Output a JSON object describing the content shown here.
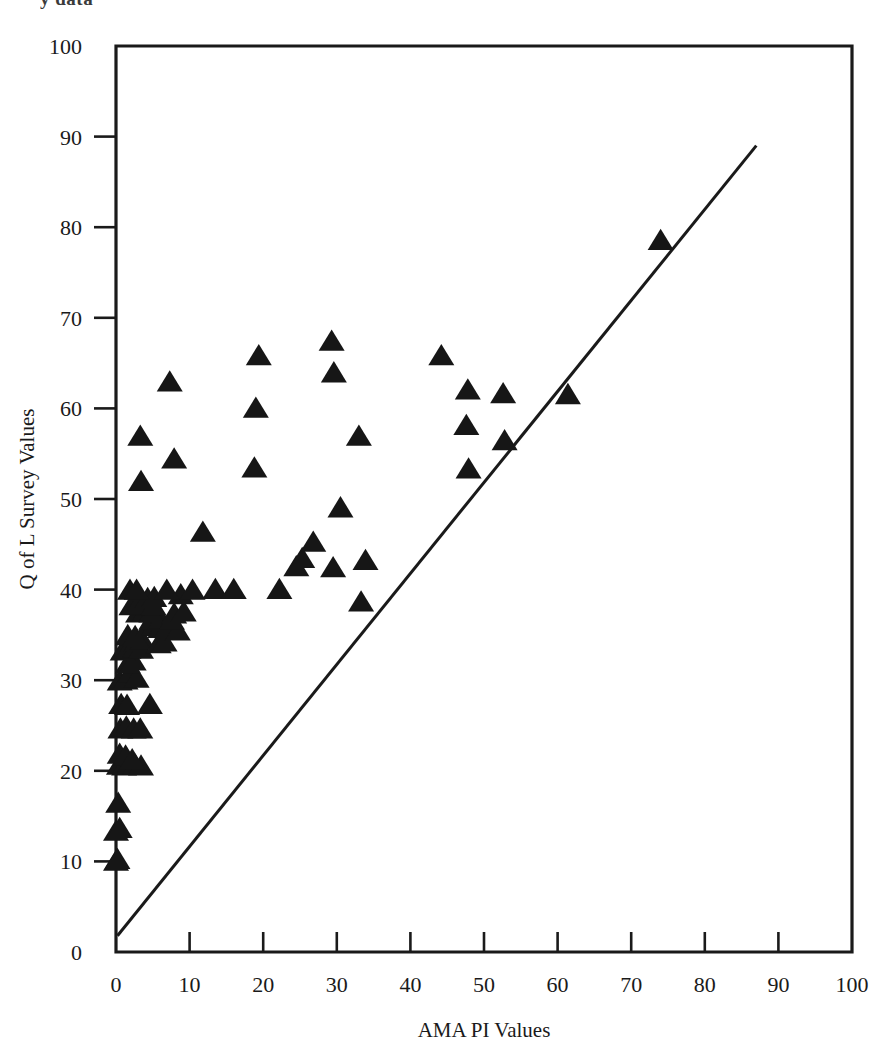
{
  "figure": {
    "top_caption_fragment": "y data",
    "background_color": "#ffffff",
    "ink_color": "#161616"
  },
  "chart_data": {
    "type": "scatter",
    "title": "",
    "xlabel": "AMA PI Values",
    "ylabel": "Q of L Survey Values",
    "xlim": [
      0,
      100
    ],
    "ylim": [
      0,
      100
    ],
    "xticks": [
      0,
      10,
      20,
      30,
      40,
      50,
      60,
      70,
      80,
      90,
      100
    ],
    "yticks": [
      0,
      10,
      20,
      30,
      40,
      50,
      60,
      70,
      80,
      90,
      100
    ],
    "xticklabels": [
      "0",
      "10",
      "20",
      "30",
      "40",
      "50",
      "60",
      "70",
      "80",
      "90",
      "100"
    ],
    "yticklabels": [
      "0",
      "10",
      "20",
      "30",
      "40",
      "50",
      "60",
      "70",
      "80",
      "90",
      "100"
    ],
    "grid": false,
    "legend": null,
    "marker": "triangle-up",
    "marker_color": "#161616",
    "marker_size": 13,
    "reference_line": {
      "name": "identity-line",
      "x": [
        0.2,
        87.0
      ],
      "y": [
        1.8,
        89.0
      ],
      "style": "solid",
      "color": "#1a1a1a"
    },
    "points": [
      [
        0.0,
        10.0
      ],
      [
        0.2,
        10.2
      ],
      [
        0.0,
        13.3
      ],
      [
        0.5,
        13.6
      ],
      [
        0.3,
        16.4
      ],
      [
        0.4,
        20.6
      ],
      [
        1.1,
        20.5
      ],
      [
        1.9,
        20.8
      ],
      [
        2.6,
        20.6
      ],
      [
        3.4,
        20.5
      ],
      [
        0.5,
        21.8
      ],
      [
        1.3,
        21.6
      ],
      [
        2.2,
        21.2
      ],
      [
        0.6,
        24.6
      ],
      [
        1.4,
        24.8
      ],
      [
        2.4,
        24.6
      ],
      [
        3.3,
        24.6
      ],
      [
        0.7,
        27.3
      ],
      [
        1.5,
        27.2
      ],
      [
        4.6,
        27.3
      ],
      [
        0.5,
        29.9
      ],
      [
        1.3,
        30.0
      ],
      [
        2.0,
        30.8
      ],
      [
        2.8,
        30.2
      ],
      [
        1.6,
        31.8
      ],
      [
        2.4,
        32.1
      ],
      [
        0.9,
        33.2
      ],
      [
        1.7,
        33.4
      ],
      [
        2.6,
        33.5
      ],
      [
        3.4,
        33.4
      ],
      [
        2.8,
        34.2
      ],
      [
        3.6,
        34.4
      ],
      [
        5.8,
        34.0
      ],
      [
        6.6,
        34.2
      ],
      [
        1.6,
        34.9
      ],
      [
        2.6,
        34.8
      ],
      [
        4.4,
        35.9
      ],
      [
        5.2,
        36.0
      ],
      [
        6.0,
        35.7
      ],
      [
        7.0,
        35.8
      ],
      [
        8.4,
        35.4
      ],
      [
        4.8,
        36.6
      ],
      [
        6.1,
        36.7
      ],
      [
        7.6,
        36.6
      ],
      [
        3.0,
        37.4
      ],
      [
        3.9,
        37.5
      ],
      [
        4.8,
        37.4
      ],
      [
        7.9,
        37.3
      ],
      [
        9.2,
        37.5
      ],
      [
        2.1,
        38.2
      ],
      [
        3.0,
        38.3
      ],
      [
        5.1,
        38.2
      ],
      [
        33.3,
        38.6
      ],
      [
        4.3,
        39.0
      ],
      [
        5.2,
        39.1
      ],
      [
        8.8,
        39.4
      ],
      [
        1.9,
        39.9
      ],
      [
        2.8,
        39.9
      ],
      [
        6.9,
        39.9
      ],
      [
        10.4,
        39.9
      ],
      [
        13.5,
        40.0
      ],
      [
        16.0,
        40.0
      ],
      [
        22.2,
        40.0
      ],
      [
        24.5,
        42.5
      ],
      [
        29.5,
        42.4
      ],
      [
        25.3,
        43.4
      ],
      [
        33.9,
        43.2
      ],
      [
        26.8,
        45.2
      ],
      [
        11.8,
        46.3
      ],
      [
        30.5,
        49.0
      ],
      [
        3.4,
        51.9
      ],
      [
        18.8,
        53.4
      ],
      [
        7.9,
        54.4
      ],
      [
        47.9,
        53.3
      ],
      [
        3.3,
        56.9
      ],
      [
        33.0,
        56.9
      ],
      [
        52.8,
        56.4
      ],
      [
        47.6,
        58.1
      ],
      [
        19.0,
        60.0
      ],
      [
        47.8,
        62.0
      ],
      [
        52.6,
        61.6
      ],
      [
        61.4,
        61.5
      ],
      [
        7.3,
        62.9
      ],
      [
        29.6,
        63.9
      ],
      [
        19.4,
        65.8
      ],
      [
        44.2,
        65.8
      ],
      [
        29.3,
        67.4
      ],
      [
        74.0,
        78.5
      ]
    ],
    "n_points": 88
  }
}
